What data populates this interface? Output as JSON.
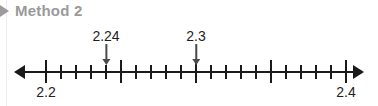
{
  "header": {
    "icon": "disclosure-triangle-right-icon",
    "title": "Method 2"
  },
  "number_line": {
    "left_arrow_icon": "arrow-left-icon",
    "right_arrow_icon": "arrow-right-icon",
    "start_label": "2.2",
    "end_label": "2.4",
    "start_value": 2.2,
    "end_value": 2.4,
    "minor_step": 0.01,
    "major_every": 5,
    "total_intervals": 20,
    "callouts": [
      {
        "label": "2.24",
        "value": 2.24,
        "arrow_icon": "arrow-down-icon"
      },
      {
        "label": "2.3",
        "value": 2.3,
        "arrow_icon": "arrow-down-icon"
      }
    ]
  },
  "geometry": {
    "axis_left_px": 46,
    "axis_right_px": 346,
    "px_per_interval": 15,
    "label_top_px": 28,
    "shaft_height_px": 15
  },
  "colors": {
    "header_gray": "#9a9a9a",
    "line_black": "#1a1a1a",
    "callout_gray": "#4a4a4a",
    "background": "#ffffff",
    "margin_rule": "#ededed"
  }
}
